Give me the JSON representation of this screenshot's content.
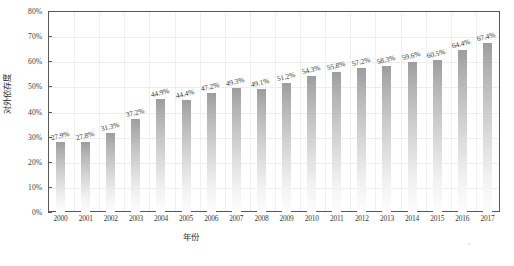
{
  "chart_data": {
    "type": "bar",
    "title": "",
    "xlabel": "年份",
    "ylabel": "对外依存度",
    "categories": [
      "2000",
      "2001",
      "2002",
      "2003",
      "2004",
      "2005",
      "2006",
      "2007",
      "2008",
      "2009",
      "2010",
      "2011",
      "2012",
      "2013",
      "2014",
      "2015",
      "2016",
      "2017"
    ],
    "values": [
      27.9,
      27.8,
      31.3,
      37.2,
      44.9,
      44.4,
      47.2,
      49.3,
      49.1,
      51.2,
      54.3,
      55.8,
      57.2,
      58.3,
      59.6,
      60.5,
      64.4,
      67.4
    ],
    "data_labels": [
      "27.9%",
      "27.8%",
      "31.3%",
      "37.2%",
      "44.9%",
      "44.4%",
      "47.2%",
      "49.3%",
      "49.1%",
      "51.2%",
      "54.3%",
      "55.8%",
      "57.2%",
      "58.3%",
      "59.6%",
      "60.5%",
      "64.4%",
      "67.4%"
    ],
    "ylim": [
      0,
      80
    ],
    "ytick_values": [
      0,
      10,
      20,
      30,
      40,
      50,
      60,
      70,
      80
    ],
    "ytick_labels": [
      "0%",
      "10%",
      "20%",
      "30%",
      "40%",
      "50%",
      "60%",
      "70%",
      "80%"
    ],
    "grid": true,
    "legend": false,
    "legend_position": "none",
    "bar_color_top": "#9d9d9f",
    "bar_color_bottom": "#fdfdfd",
    "frame_color": "#58585a",
    "grid_color": "#ededee",
    "text_color": "#3a3a3c"
  }
}
